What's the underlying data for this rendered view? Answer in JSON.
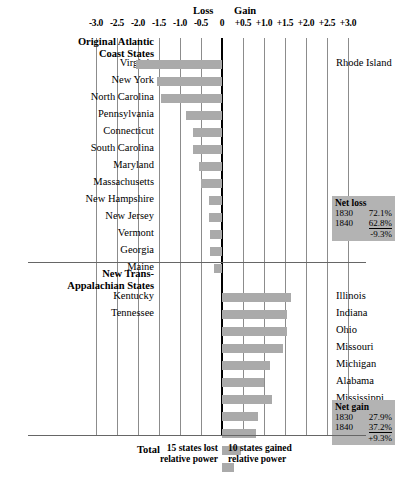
{
  "chart_data": {
    "type": "bar",
    "title": "",
    "xlabel": "",
    "ylabel": "",
    "orientation": "horizontal",
    "xlim": [
      -3.0,
      3.0
    ],
    "grid": true,
    "axis_ticks": [
      "-3.0",
      "-2.5",
      "-2.0",
      "-1.5",
      "-1.0",
      "-0.5",
      "0",
      "+0.5",
      "+1.0",
      "+1.5",
      "+2.0",
      "+2.5",
      "+3.0"
    ],
    "axis_tick_values": [
      -3.0,
      -2.5,
      -2.0,
      -1.5,
      -1.0,
      -0.5,
      0,
      0.5,
      1.0,
      1.5,
      2.0,
      2.5,
      3.0
    ],
    "direction_labels": {
      "left": "Loss",
      "right": "Gain"
    },
    "groups": [
      {
        "name": "Original Atlantic Coast States",
        "name_line1": "Original Atlantic",
        "name_line2": "Coast States",
        "categories": [
          "Virginia",
          "New York",
          "North Carolina",
          "Pennsylvania",
          "Connecticut",
          "South Carolina",
          "Maryland",
          "Massachusetts",
          "New Hampshire",
          "New Jersey",
          "Vermont",
          "Georgia",
          "Maine"
        ],
        "values": [
          -2.05,
          -1.55,
          -1.45,
          -0.85,
          -0.7,
          -0.7,
          -0.55,
          -0.5,
          -0.3,
          -0.3,
          -0.28,
          -0.28,
          -0.2
        ],
        "extra_right_labels": [
          "Rhode Island"
        ]
      },
      {
        "name": "New Trans-Appalachian States",
        "name_line1": "New Trans-",
        "name_line2": "Appalachian States",
        "categories": [
          "Kentucky",
          "Tennessee"
        ],
        "values": [
          1.65,
          1.55
        ],
        "right_labels": [
          "Illinois",
          "Indiana",
          "Ohio",
          "Missouri",
          "Michigan",
          "Alabama",
          "Mississippi",
          "Louisiana",
          "Arkansas"
        ],
        "right_values": [
          1.55,
          1.45,
          1.15,
          1.0,
          1.2,
          0.85,
          0.8,
          0.45,
          0.28
        ]
      }
    ],
    "annotations": {
      "net_loss": {
        "title": "Net loss",
        "rows": [
          {
            "year": "1830",
            "pct": "72.1%"
          },
          {
            "year": "1840",
            "pct": "62.8%"
          }
        ],
        "change": "-9.3%"
      },
      "net_gain": {
        "title": "Net gain",
        "rows": [
          {
            "year": "1830",
            "pct": "27.9%"
          },
          {
            "year": "1840",
            "pct": "37.2%"
          }
        ],
        "change": "+9.3%"
      },
      "total_label": "Total",
      "footnote_left_line1": "15 states lost",
      "footnote_left_line2": "relative power",
      "footnote_right_line1": "10 states gained",
      "footnote_right_line2": "relative power"
    },
    "colors": {
      "bar": "#aaaaaa",
      "grid": "#8c8c8c",
      "zero_axis": "#000000",
      "netbox_bg": "#b3b3b3",
      "background": "#ffffff"
    }
  }
}
